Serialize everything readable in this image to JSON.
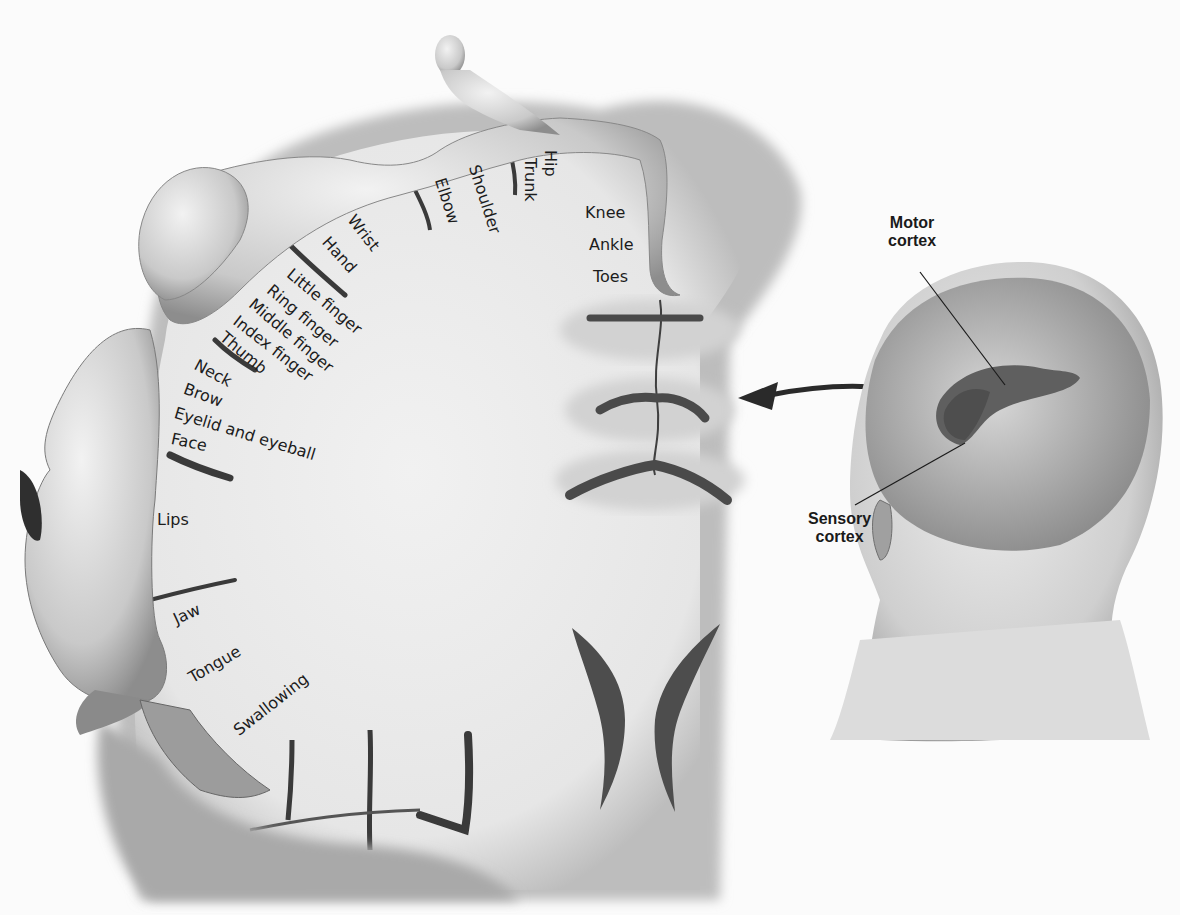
{
  "figure": {
    "body_part_labels": [
      {
        "id": "hip",
        "text": "Hip",
        "x": 553,
        "y": 160,
        "rot": 90
      },
      {
        "id": "trunk",
        "text": "Trunk",
        "x": 532,
        "y": 160,
        "rot": 90
      },
      {
        "id": "shoulder",
        "text": "Shoulder",
        "x": 477,
        "y": 165,
        "rot": 72
      },
      {
        "id": "elbow",
        "text": "Elbow",
        "x": 443,
        "y": 176,
        "rot": 72
      },
      {
        "id": "knee",
        "text": "Knee",
        "x": 585,
        "y": 206,
        "rot": 0
      },
      {
        "id": "ankle",
        "text": "Ankle",
        "x": 589,
        "y": 238,
        "rot": 0
      },
      {
        "id": "toes",
        "text": "Toes",
        "x": 593,
        "y": 270,
        "rot": 0
      },
      {
        "id": "wrist",
        "text": "Wrist",
        "x": 357,
        "y": 218,
        "rot": 52
      },
      {
        "id": "hand",
        "text": "Hand",
        "x": 332,
        "y": 240,
        "rot": 48
      },
      {
        "id": "little_finger",
        "text": "Little finger",
        "x": 292,
        "y": 272,
        "rot": 40
      },
      {
        "id": "ring_finger",
        "text": "Ring finger",
        "x": 272,
        "y": 288,
        "rot": 40
      },
      {
        "id": "middle_finger",
        "text": "Middle finger",
        "x": 253,
        "y": 302,
        "rot": 40
      },
      {
        "id": "index_finger",
        "text": "Index finger",
        "x": 237,
        "y": 318,
        "rot": 38
      },
      {
        "id": "thumb",
        "text": "Thumb",
        "x": 225,
        "y": 334,
        "rot": 40
      },
      {
        "id": "neck",
        "text": "Neck",
        "x": 198,
        "y": 362,
        "rot": 28
      },
      {
        "id": "brow",
        "text": "Brow",
        "x": 186,
        "y": 386,
        "rot": 20
      },
      {
        "id": "eyelid_eyeball",
        "text": "Eyelid and eyeball",
        "x": 176,
        "y": 410,
        "rot": 17
      },
      {
        "id": "face",
        "text": "Face",
        "x": 172,
        "y": 435,
        "rot": 12
      },
      {
        "id": "lips",
        "text": "Lips",
        "x": 157,
        "y": 517,
        "rot": 0
      },
      {
        "id": "jaw",
        "text": "Jaw",
        "x": 172,
        "y": 608,
        "rot": -25
      },
      {
        "id": "tongue",
        "text": "Tongue",
        "x": 188,
        "y": 666,
        "rot": -30
      },
      {
        "id": "swallowing",
        "text": "Swallowing",
        "x": 233,
        "y": 722,
        "rot": -38
      }
    ],
    "callouts": {
      "motor_cortex": {
        "line1": "Motor",
        "line2": "cortex"
      },
      "sensory_cortex": {
        "line1": "Sensory",
        "line2": "cortex"
      }
    },
    "colors": {
      "background": "#fbfbfb",
      "cortex_fill": "#ececec",
      "gyrus_shadow": "#cfcfcf",
      "sulcus": "#5a5a5a",
      "skin": "#d9d9d9",
      "highlighted_cortex": "#6e6e6e",
      "text": "#1c1c1c"
    }
  }
}
